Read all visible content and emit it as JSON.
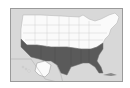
{
  "map": {
    "subject": "United States map with southern region shaded",
    "regions": [
      {
        "name": "northern-states",
        "shade": "white"
      },
      {
        "name": "southern-states",
        "shade": "dark-gray"
      },
      {
        "name": "alaska-inset",
        "shade": "white"
      }
    ],
    "colors": {
      "background": "#d8d8d8",
      "land_north": "#fafafa",
      "land_south": "#5a5a5a",
      "border": "#9a9a9a",
      "state_lines": "#b0b0b0"
    }
  }
}
